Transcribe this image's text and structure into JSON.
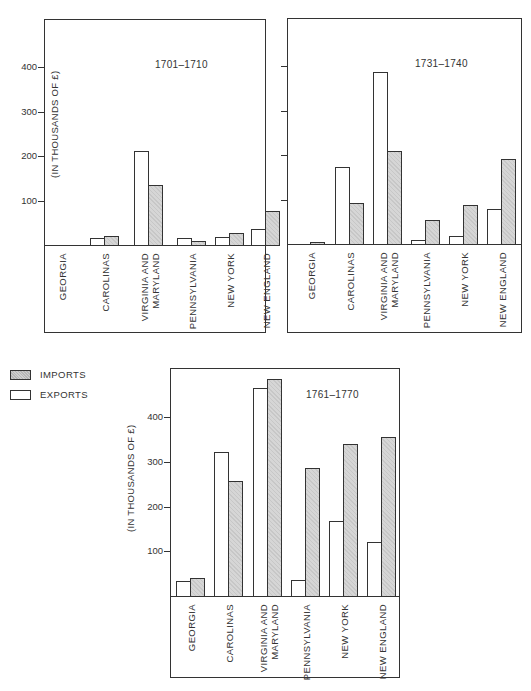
{
  "legend": {
    "imports_label": "IMPORTS",
    "exports_label": "EXPORTS"
  },
  "y_axis_label": "(IN THOUSANDS OF £)",
  "colors": {
    "exports_fill": "#ffffff",
    "imports_fill": "#d6d6d6",
    "line": "#333333"
  },
  "chart_data": [
    {
      "type": "bar",
      "title": "1701–1710",
      "xlabel": "",
      "ylabel": "(IN THOUSANDS OF £)",
      "ylim": [
        0,
        450
      ],
      "yticks": [
        100,
        200,
        300,
        400
      ],
      "categories": [
        "GEORGIA",
        "CAROLINAS",
        "VIRGINIA AND MARYLAND",
        "PENNSYLVANIA",
        "NEW YORK",
        "NEW ENGLAND"
      ],
      "series": [
        {
          "name": "EXPORTS",
          "values": [
            0,
            15,
            212,
            15,
            18,
            35
          ]
        },
        {
          "name": "IMPORTS",
          "values": [
            0,
            20,
            135,
            10,
            26,
            77
          ]
        }
      ],
      "legend_position": "bottom-left (shared)",
      "grid": false
    },
    {
      "type": "bar",
      "title": "1731–1740",
      "xlabel": "",
      "ylabel": "(IN THOUSANDS OF £)",
      "ylim": [
        0,
        450
      ],
      "yticks": [
        100,
        200,
        300,
        400
      ],
      "categories": [
        "GEORGIA",
        "CAROLINAS",
        "VIRGINIA AND MARYLAND",
        "PENNSYLVANIA",
        "NEW YORK",
        "NEW ENGLAND"
      ],
      "series": [
        {
          "name": "EXPORTS",
          "values": [
            0,
            174,
            386,
            10,
            17,
            79
          ]
        },
        {
          "name": "IMPORTS",
          "values": [
            2,
            93,
            208,
            55,
            88,
            190
          ]
        }
      ],
      "legend_position": "bottom-left (shared)",
      "grid": false
    },
    {
      "type": "bar",
      "title": "1761–1770",
      "xlabel": "",
      "ylabel": "(IN THOUSANDS OF £)",
      "ylim": [
        0,
        500
      ],
      "yticks": [
        100,
        200,
        300,
        400
      ],
      "categories": [
        "GEORGIA",
        "CAROLINAS",
        "VIRGINIA AND MARYLAND",
        "PENNSYLVANIA",
        "NEW YORK",
        "NEW ENGLAND"
      ],
      "series": [
        {
          "name": "EXPORTS",
          "values": [
            33,
            322,
            465,
            36,
            168,
            120
          ]
        },
        {
          "name": "IMPORTS",
          "values": [
            40,
            258,
            487,
            287,
            341,
            356
          ]
        }
      ],
      "legend_position": "top-left",
      "grid": false
    }
  ],
  "category_labels": [
    "GEORGIA",
    "CAROLINAS",
    "VIRGINIA AND\nMARYLAND",
    "PENNSYLVANIA",
    "NEW YORK",
    "NEW ENGLAND"
  ],
  "tick_labels": [
    "100",
    "200",
    "300",
    "400"
  ]
}
